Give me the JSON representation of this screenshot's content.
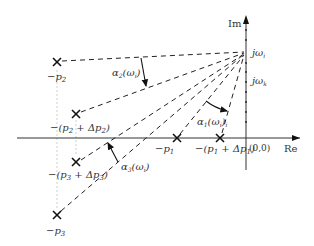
{
  "axes": {
    "imag_label": "Im",
    "real_label": "Re",
    "origin_label": "(0,0)"
  },
  "imag_axis_marks": {
    "omega_i": "jω",
    "omega_i_sub": "i",
    "omega_k": "jω",
    "omega_k_sub": "k"
  },
  "poles": [
    {
      "id": "p2",
      "label": "−p",
      "sub": "2"
    },
    {
      "id": "p2_shift",
      "label": "−(p",
      "sub": "2",
      "mid": " + Δp",
      "sub2": "2",
      "tail": ")"
    },
    {
      "id": "p3_shift",
      "label": "−(p",
      "sub": "3",
      "mid": " + Δp",
      "sub2": "3",
      "tail": ")"
    },
    {
      "id": "p3",
      "label": "−p",
      "sub": "3"
    },
    {
      "id": "p1",
      "label": "−p",
      "sub": "1"
    },
    {
      "id": "p1_shift",
      "label": "−(p",
      "sub": "1",
      "mid": " + Δp",
      "sub2": "1",
      "tail": ")"
    }
  ],
  "angles": [
    {
      "id": "alpha2",
      "label": "α",
      "sub": "2",
      "arg": "(ω",
      "argsub": "i",
      "tail": ")"
    },
    {
      "id": "alpha1",
      "label": "α",
      "sub": "1",
      "arg": "(ω",
      "argsub": "i",
      "tail": ")",
      "outer_sub": "i"
    },
    {
      "id": "alpha3",
      "label": "α",
      "sub": "3",
      "arg": "(ω",
      "argsub": "i",
      "tail": ")"
    }
  ]
}
